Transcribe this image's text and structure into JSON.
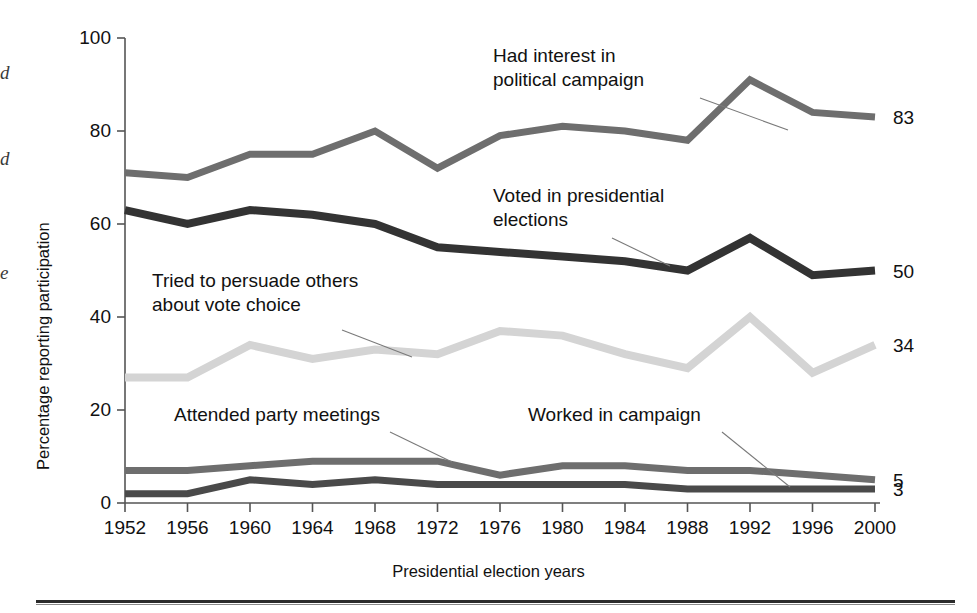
{
  "figure": {
    "margin_fragments": [
      "d",
      "d",
      "e"
    ],
    "bottom_rule": "horizontal-rule"
  },
  "axes": {
    "y_title": "Percentage reporting participation",
    "x_title": "Presidential election years",
    "y_ticks": [
      "0",
      "20",
      "40",
      "60",
      "80",
      "100"
    ],
    "x_ticks": [
      "1952",
      "1956",
      "1960",
      "1964",
      "1968",
      "1972",
      "1976",
      "1980",
      "1984",
      "1988",
      "1992",
      "1996",
      "2000"
    ]
  },
  "annotations": [
    {
      "id": "interest",
      "lines": [
        "Had interest in",
        "political campaign"
      ],
      "x": 493,
      "y": 62
    },
    {
      "id": "voted",
      "lines": [
        "Voted in presidential",
        "elections"
      ],
      "x": 493,
      "y": 202
    },
    {
      "id": "persuade",
      "lines": [
        "Tried to persuade others",
        "about vote choice"
      ],
      "x": 152,
      "y": 287
    },
    {
      "id": "attended",
      "lines": [
        "Attended party meetings"
      ],
      "x": 174,
      "y": 421
    },
    {
      "id": "worked",
      "lines": [
        "Worked in campaign"
      ],
      "x": 528,
      "y": 421
    }
  ],
  "colors": {
    "interest": "#6e6e6e",
    "voted": "#333333",
    "persuade": "#d4d4d4",
    "attended": "#6e6e6e",
    "worked": "#4a4a4a",
    "axis": "#555555",
    "text": "#111111",
    "leader": "#7a7a7a"
  },
  "chart_data": {
    "type": "line",
    "title": "",
    "xlabel": "Presidential election years",
    "ylabel": "Percentage reporting participation",
    "ylim": [
      0,
      100
    ],
    "grid": false,
    "legend": "annotations",
    "categories": [
      "1952",
      "1956",
      "1960",
      "1964",
      "1968",
      "1972",
      "1976",
      "1980",
      "1984",
      "1988",
      "1992",
      "1996",
      "2000"
    ],
    "series": [
      {
        "name": "Had interest in political campaign",
        "color": "#6e6e6e",
        "end_label": "83",
        "values": [
          71,
          70,
          75,
          75,
          80,
          72,
          79,
          81,
          80,
          78,
          91,
          84,
          83
        ]
      },
      {
        "name": "Voted in presidential elections",
        "color": "#333333",
        "end_label": "50",
        "values": [
          63,
          60,
          63,
          62,
          60,
          55,
          54,
          53,
          52,
          50,
          57,
          49,
          50
        ]
      },
      {
        "name": "Tried to persuade others about vote choice",
        "color": "#d4d4d4",
        "end_label": "34",
        "values": [
          27,
          27,
          34,
          31,
          33,
          32,
          37,
          36,
          32,
          29,
          40,
          28,
          34
        ]
      },
      {
        "name": "Attended party meetings",
        "color": "#6e6e6e",
        "end_label": "5",
        "values": [
          7,
          7,
          8,
          9,
          9,
          9,
          6,
          8,
          8,
          7,
          7,
          6,
          5
        ]
      },
      {
        "name": "Worked in campaign",
        "color": "#4a4a4a",
        "end_label": "3",
        "values": [
          2,
          2,
          5,
          4,
          5,
          4,
          4,
          4,
          4,
          3,
          3,
          3,
          3
        ]
      }
    ]
  }
}
